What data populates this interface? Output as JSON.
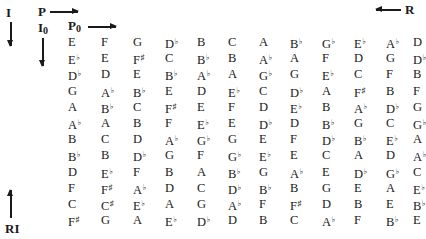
{
  "labels": {
    "inversion": "I",
    "prime": "P",
    "retrograde": "R",
    "retrograde_inversion": "RI",
    "inversion_zero": {
      "base": "I",
      "sub": "0"
    },
    "prime_zero": {
      "base": "P",
      "sub": "0"
    }
  },
  "icons": {
    "prime_arrow": "arrow-right",
    "prime_zero_arrow": "arrow-right",
    "retrograde_arrow": "arrow-left",
    "inversion_arrow": "arrow-down",
    "inversion_zero_arrow": "arrow-down",
    "retrograde_inversion_arrow": "arrow-up"
  },
  "matrix": {
    "rows": [
      [
        "E",
        "F",
        "G",
        "D♭",
        "B",
        "C",
        "A",
        "B♭",
        "G♭",
        "E♭",
        "A♭",
        "D"
      ],
      [
        "E♭",
        "E",
        "F♯",
        "C",
        "B♭",
        "B",
        "A♭",
        "A",
        "F",
        "D",
        "G",
        "D♭"
      ],
      [
        "D♭",
        "D",
        "E",
        "B♭",
        "A♭",
        "A",
        "G♭",
        "G",
        "E♭",
        "C",
        "F",
        "B"
      ],
      [
        "G",
        "A♭",
        "B♭",
        "E",
        "D",
        "E♭",
        "C",
        "D♭",
        "A",
        "F♯",
        "B",
        "F"
      ],
      [
        "A",
        "B♭",
        "C",
        "F♯",
        "E",
        "F",
        "D",
        "E♭",
        "B",
        "A♭",
        "D♭",
        "G"
      ],
      [
        "A♭",
        "A",
        "B",
        "F",
        "E♭",
        "E",
        "D♭",
        "D",
        "B♭",
        "G",
        "C",
        "G♭"
      ],
      [
        "B",
        "C",
        "D",
        "A♭",
        "G♭",
        "G",
        "E",
        "F",
        "D♭",
        "B♭",
        "E♭",
        "A"
      ],
      [
        "B♭",
        "B",
        "D♭",
        "G",
        "F",
        "G♭",
        "E♭",
        "E",
        "C",
        "A",
        "D",
        "A♭"
      ],
      [
        "D",
        "E♭",
        "F",
        "B",
        "A",
        "B♭",
        "G",
        "A♭",
        "E",
        "D♭",
        "G♭",
        "C"
      ],
      [
        "F",
        "F♯",
        "A♭",
        "D",
        "C",
        "D♭",
        "B♭",
        "B",
        "G",
        "E",
        "A",
        "E♭"
      ],
      [
        "C",
        "C♯",
        "E♭",
        "A",
        "G",
        "A♭",
        "F",
        "F♯",
        "D",
        "B",
        "E",
        "B♭"
      ],
      [
        "F♯",
        "G",
        "A",
        "E♭",
        "D♭",
        "D",
        "B",
        "C",
        "A♭",
        "F",
        "B♭",
        "E"
      ]
    ]
  }
}
